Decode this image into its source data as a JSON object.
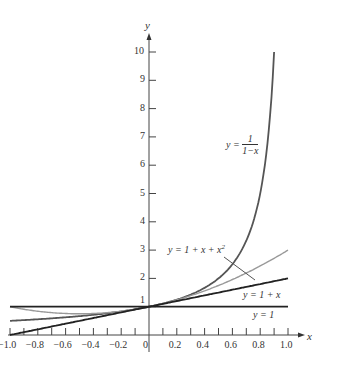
{
  "chart_data": {
    "type": "line",
    "title": "",
    "xlabel": "x",
    "ylabel": "y",
    "xlim": [
      -1.0,
      1.0
    ],
    "ylim": [
      0,
      10
    ],
    "grid": false,
    "x_ticks": [
      "-1.0",
      "-0.8",
      "-0.6",
      "-0.4",
      "-0.2",
      "0",
      "0.2",
      "0.4",
      "0.6",
      "0.8",
      "1.0"
    ],
    "y_ticks": [
      "1",
      "2",
      "3",
      "4",
      "5",
      "6",
      "7",
      "8",
      "9",
      "10"
    ],
    "series": [
      {
        "name": "y = 1/(1-x)",
        "function": "1/(1-x)",
        "domain": [
          -1.0,
          0.9
        ],
        "color": "#555555",
        "x": [
          -1.0,
          -0.8,
          -0.6,
          -0.4,
          -0.2,
          0,
          0.2,
          0.4,
          0.6,
          0.8,
          0.9
        ],
        "values": [
          0.5,
          0.556,
          0.625,
          0.714,
          0.833,
          1,
          1.25,
          1.667,
          2.5,
          5,
          10
        ]
      },
      {
        "name": "y = 1 + x + x^2",
        "function": "1+x+x^2",
        "domain": [
          -1.0,
          1.0
        ],
        "color": "#999999",
        "x": [
          -1.0,
          -0.8,
          -0.6,
          -0.4,
          -0.2,
          0,
          0.2,
          0.4,
          0.6,
          0.8,
          1.0
        ],
        "values": [
          1,
          0.84,
          0.76,
          0.76,
          0.84,
          1,
          1.24,
          1.56,
          1.96,
          2.44,
          3
        ]
      },
      {
        "name": "y = 1 + x",
        "function": "1+x",
        "domain": [
          -1.0,
          1.0
        ],
        "color": "#222222",
        "x": [
          -1.0,
          1.0
        ],
        "values": [
          0,
          2
        ]
      },
      {
        "name": "y = 1",
        "function": "1",
        "domain": [
          -1.0,
          1.0
        ],
        "color": "#222222",
        "x": [
          -1.0,
          1.0
        ],
        "values": [
          1,
          1
        ]
      }
    ],
    "annotations": [
      {
        "text": "y = 1/(1-x)",
        "near": [
          0.62,
          6.6
        ]
      },
      {
        "text": "y = 1 + x + x^2",
        "near": [
          0.1,
          3.0
        ],
        "pointer_to": [
          0.76,
          2.3
        ]
      },
      {
        "text": "y = 1 + x",
        "near": [
          0.75,
          1.4
        ]
      },
      {
        "text": "y = 1",
        "near": [
          0.8,
          0.8
        ]
      }
    ]
  },
  "labels": {
    "x_axis": "x",
    "y_axis": "y",
    "eq_recip_lhs": "y =",
    "eq_recip_num": "1",
    "eq_recip_den": "1−x",
    "eq_quad_a": "y = 1 + x + x",
    "eq_quad_sup": "2",
    "eq_lin": "y = 1 + x",
    "eq_const": "y = 1"
  }
}
